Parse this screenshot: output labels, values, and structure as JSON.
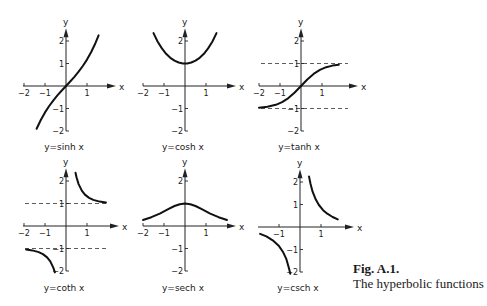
{
  "figure": {
    "label": "Fig. A.1.",
    "caption": "The hyperbolic functions"
  },
  "chart_data": [
    {
      "type": "line",
      "title": "y=sinh x",
      "xlabel": "x",
      "ylabel": "y",
      "xlim": [
        -2,
        1.6
      ],
      "ylim": [
        -2,
        2.3
      ],
      "xticks": [
        -2,
        -1,
        1
      ],
      "yticks": [
        -2,
        -1,
        1,
        2
      ],
      "asymptotes": [],
      "series": [
        {
          "name": "sinh",
          "x": [
            -1.4,
            -1.2,
            -1.0,
            -0.8,
            -0.6,
            -0.4,
            -0.2,
            0,
            0.2,
            0.4,
            0.6,
            0.8,
            1.0,
            1.2,
            1.4,
            1.55
          ],
          "y": [
            -1.904,
            -1.509,
            -1.175,
            -0.888,
            -0.637,
            -0.411,
            -0.201,
            0,
            0.201,
            0.411,
            0.637,
            0.888,
            1.175,
            1.509,
            1.904,
            2.25
          ]
        }
      ]
    },
    {
      "type": "line",
      "title": "y=cosh x",
      "xlabel": "x",
      "ylabel": "y",
      "xlim": [
        -2,
        1.6
      ],
      "ylim": [
        -2,
        2.3
      ],
      "xticks": [
        -2,
        -1,
        1
      ],
      "yticks": [
        -2,
        -1,
        2
      ],
      "asymptotes": [],
      "series": [
        {
          "name": "cosh",
          "x": [
            -1.5,
            -1.3,
            -1.1,
            -0.9,
            -0.7,
            -0.5,
            -0.3,
            -0.1,
            0,
            0.1,
            0.3,
            0.5,
            0.7,
            0.9,
            1.1,
            1.3,
            1.5
          ],
          "y": [
            2.352,
            1.971,
            1.669,
            1.433,
            1.255,
            1.128,
            1.045,
            1.005,
            1.0,
            1.005,
            1.045,
            1.128,
            1.255,
            1.433,
            1.669,
            1.971,
            2.352
          ]
        }
      ]
    },
    {
      "type": "line",
      "title": "y=tanh x",
      "xlabel": "x",
      "ylabel": "y",
      "xlim": [
        -2,
        1.9
      ],
      "ylim": [
        -2,
        2.3
      ],
      "xticks": [
        -2,
        -1,
        1
      ],
      "yticks": [
        -2,
        -1,
        1,
        2
      ],
      "asymptotes": [
        1,
        -1
      ],
      "series": [
        {
          "name": "tanh",
          "x": [
            -2.0,
            -1.6,
            -1.2,
            -0.9,
            -0.6,
            -0.3,
            0,
            0.3,
            0.6,
            0.9,
            1.2,
            1.5,
            1.8
          ],
          "y": [
            -0.964,
            -0.922,
            -0.834,
            -0.716,
            -0.537,
            -0.291,
            0,
            0.291,
            0.537,
            0.716,
            0.834,
            0.905,
            0.947
          ]
        }
      ]
    },
    {
      "type": "line",
      "title": "y=coth x",
      "xlabel": "x",
      "ylabel": "y",
      "xlim": [
        -2,
        1.9
      ],
      "ylim": [
        -2,
        2.3
      ],
      "xticks": [
        -2,
        -1,
        1
      ],
      "yticks": [
        -2,
        -1,
        1,
        2
      ],
      "asymptotes": [
        1,
        -1
      ],
      "series": [
        {
          "name": "coth-neg",
          "x": [
            -1.9,
            -1.6,
            -1.3,
            -1.1,
            -0.9,
            -0.75,
            -0.6,
            -0.53
          ],
          "y": [
            -1.046,
            -1.085,
            -1.161,
            -1.249,
            -1.396,
            -1.574,
            -1.862,
            -2.06
          ]
        },
        {
          "name": "coth-pos",
          "x": [
            0.45,
            0.5,
            0.6,
            0.75,
            0.9,
            1.1,
            1.3,
            1.6,
            1.9
          ],
          "y": [
            2.37,
            2.164,
            1.862,
            1.574,
            1.396,
            1.249,
            1.161,
            1.085,
            1.046
          ]
        }
      ]
    },
    {
      "type": "line",
      "title": "y=sech x",
      "xlabel": "x",
      "ylabel": "y",
      "xlim": [
        -2,
        1.9
      ],
      "ylim": [
        -2,
        2.3
      ],
      "xticks": [
        -2,
        -1,
        1
      ],
      "yticks": [
        -2,
        -1,
        2
      ],
      "asymptotes": [],
      "series": [
        {
          "name": "sech",
          "x": [
            -2.0,
            -1.6,
            -1.2,
            -0.8,
            -0.5,
            -0.25,
            0,
            0.25,
            0.5,
            0.8,
            1.2,
            1.6,
            2.0
          ],
          "y": [
            0.266,
            0.389,
            0.552,
            0.748,
            0.887,
            0.97,
            1.0,
            0.97,
            0.887,
            0.748,
            0.552,
            0.389,
            0.266
          ]
        }
      ]
    },
    {
      "type": "line",
      "title": "y=csch x",
      "xlabel": "x",
      "ylabel": "y",
      "xlim": [
        -2,
        1.9
      ],
      "ylim": [
        -2,
        2.3
      ],
      "xticks": [
        -1,
        1
      ],
      "yticks": [
        -2,
        -1,
        1,
        2
      ],
      "asymptotes": [],
      "series": [
        {
          "name": "csch-neg",
          "x": [
            -1.9,
            -1.6,
            -1.3,
            -1.0,
            -0.8,
            -0.65,
            -0.52,
            -0.46
          ],
          "y": [
            -0.302,
            -0.42,
            -0.59,
            -0.851,
            -1.126,
            -1.432,
            -1.852,
            -2.08
          ]
        },
        {
          "name": "csch-pos",
          "x": [
            0.43,
            0.5,
            0.6,
            0.75,
            0.9,
            1.1,
            1.3,
            1.55,
            1.8
          ],
          "y": [
            2.25,
            1.919,
            1.57,
            1.22,
            0.976,
            0.747,
            0.59,
            0.443,
            0.339
          ]
        }
      ]
    }
  ],
  "layout": {
    "panels": [
      {
        "ox": 66,
        "oy": 86,
        "sx": 21,
        "sy": 22.5,
        "xmin_px": 23,
        "axis_right": 110,
        "caption_y": 150
      },
      {
        "ox": 185,
        "oy": 86,
        "sx": 21,
        "sy": 22.5,
        "xmin_px": 143,
        "axis_right": 230,
        "caption_y": 150
      },
      {
        "ox": 301,
        "oy": 86,
        "sx": 21,
        "sy": 22.5,
        "xmin_px": 259,
        "axis_right": 352,
        "caption_y": 150
      },
      {
        "ox": 66,
        "oy": 226,
        "sx": 21,
        "sy": 22.5,
        "xmin_px": 23,
        "axis_right": 113,
        "caption_y": 291
      },
      {
        "ox": 185,
        "oy": 226,
        "sx": 21,
        "sy": 22.5,
        "xmin_px": 143,
        "axis_right": 230,
        "caption_y": 291
      },
      {
        "ox": 300,
        "oy": 227,
        "sx": 21,
        "sy": 22.5,
        "xmin_px": 258,
        "axis_right": 348,
        "caption_y": 291
      }
    ]
  }
}
